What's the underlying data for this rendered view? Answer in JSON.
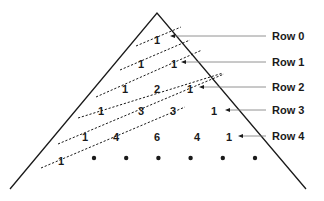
{
  "rows": [
    {
      "label": "Row 0",
      "values": [
        "1"
      ]
    },
    {
      "label": "Row 1",
      "values": [
        "1",
        "1"
      ]
    },
    {
      "label": "Row 2",
      "values": [
        "1",
        "2",
        "1"
      ]
    },
    {
      "label": "Row 3",
      "values": [
        "1",
        "3",
        "3",
        "1"
      ]
    },
    {
      "label": "Row 4",
      "values": [
        "1",
        "4",
        "6",
        "4",
        "1"
      ]
    }
  ],
  "continuation_row": {
    "first_value": "1",
    "dot_count": 6
  },
  "diagonal_count": 6
}
